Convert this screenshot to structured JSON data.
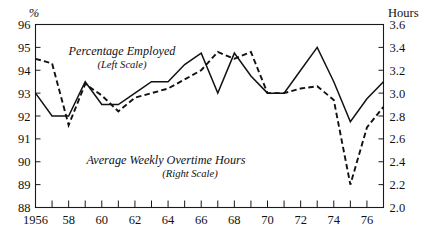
{
  "chart_data": {
    "type": "line",
    "title": "",
    "xlabel": "",
    "ylabel": "%",
    "y2label": "Hours",
    "grid": false,
    "legend_position": "inline-annotation",
    "x": [
      1956,
      1957,
      1958,
      1959,
      1960,
      1961,
      1962,
      1963,
      1964,
      1965,
      1966,
      1967,
      1968,
      1969,
      1970,
      1971,
      1972,
      1973,
      1974,
      1975,
      1976,
      1977
    ],
    "xlim": [
      1956,
      1977
    ],
    "xticks_major": [
      1956,
      1958,
      1960,
      1962,
      1964,
      1966,
      1968,
      1970,
      1972,
      1974,
      1976
    ],
    "xticklabels": [
      "1956",
      "58",
      "60",
      "62",
      "64",
      "66",
      "68",
      "70",
      "72",
      "74",
      "76"
    ],
    "ylim": [
      88,
      96
    ],
    "yticks": [
      88,
      89,
      90,
      91,
      92,
      93,
      94,
      95,
      96
    ],
    "yticklabels": [
      "88",
      "89",
      "90",
      "91",
      "92",
      "93",
      "94",
      "95",
      "96"
    ],
    "y2lim": [
      2.0,
      3.6
    ],
    "y2ticks": [
      2.0,
      2.2,
      2.4,
      2.6,
      2.8,
      3.0,
      3.2,
      3.4,
      3.6
    ],
    "y2ticklabels": [
      "2.0",
      "2.2",
      "2.4",
      "2.6",
      "2.8",
      "3.0",
      "3.2",
      "3.4",
      "3.6"
    ],
    "series": [
      {
        "name": "Percentage Employed",
        "axis": "left",
        "style": "dashed",
        "label_line1": "Percentage Employed",
        "label_line2": "(Left Scale)",
        "values": [
          94.5,
          94.3,
          91.6,
          93.4,
          92.9,
          92.2,
          92.8,
          93.0,
          93.2,
          93.6,
          94.0,
          94.8,
          94.5,
          94.8,
          93.0,
          93.0,
          93.2,
          93.3,
          92.7,
          89.0,
          91.5,
          92.4
        ]
      },
      {
        "name": "Average Weekly Overtime Hours",
        "axis": "right",
        "style": "solid",
        "label_line1": "Average Weekly Overtime Hours",
        "label_line2": "(Right Scale)",
        "values": [
          3.0,
          2.8,
          2.8,
          3.1,
          2.9,
          2.9,
          3.0,
          3.1,
          3.1,
          3.25,
          3.35,
          3.0,
          3.35,
          3.15,
          3.0,
          3.0,
          3.2,
          3.4,
          3.1,
          2.75,
          2.95,
          3.1
        ]
      }
    ]
  },
  "axes": {
    "left_unit": "%",
    "right_unit": "Hours"
  }
}
